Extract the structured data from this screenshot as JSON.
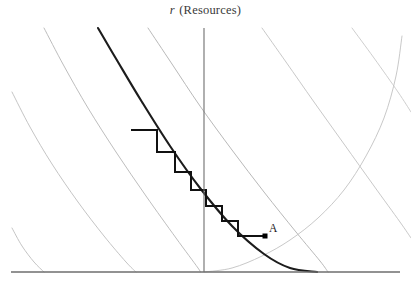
{
  "figure": {
    "width": 411,
    "height": 285,
    "background": "#ffffff"
  },
  "axis_title": {
    "symbol": "r",
    "text": " (Resources)",
    "full_text": "r (Resources)"
  },
  "labels": {
    "point_a": "A"
  },
  "colors": {
    "background": "#ffffff",
    "axis": "#6e6e6e",
    "isocline_light": "#b9b9b9",
    "isocline_mid": "#a2a2a2",
    "main_curve": "#1c1c1c",
    "staircase": "#111111",
    "point_marker": "#000000",
    "title_text": "#3a3a3a"
  },
  "chart_data": {
    "type": "line",
    "title": "r (Resources)",
    "xlabel": "",
    "ylabel": "r (Resources)",
    "grid": false,
    "legend": false,
    "axes": {
      "vertical_axis_x": 204,
      "vertical_axis_top_y": 28,
      "vertical_axis_bottom_y": 272,
      "horizontal_axis_y": 272,
      "horizontal_axis_x_start": 11,
      "horizontal_axis_x_end": 400
    },
    "isoclines": {
      "description": "family of parallel light-gray downward-convex contour curves",
      "count": 7,
      "curves": [
        {
          "name": "isocline-1",
          "shade": "#bdbdbd",
          "points": [
            [
              12,
              92
            ],
            [
              30,
              127
            ],
            [
              52,
              164
            ],
            [
              78,
              202
            ],
            [
              104,
              236
            ],
            [
              126,
              262
            ],
            [
              136,
              272
            ]
          ]
        },
        {
          "name": "isocline-2",
          "shade": "#bdbdbd",
          "points": [
            [
              12,
              228
            ],
            [
              22,
              246
            ],
            [
              34,
              262
            ],
            [
              44,
              272
            ]
          ]
        },
        {
          "name": "isocline-3",
          "shade": "#b5b5b5",
          "points": [
            [
              44,
              28
            ],
            [
              64,
              66
            ],
            [
              88,
              108
            ],
            [
              116,
              152
            ],
            [
              146,
              196
            ],
            [
              176,
              238
            ],
            [
              198,
              268
            ],
            [
              200,
              272
            ]
          ]
        },
        {
          "name": "isocline-4",
          "shade": "#b0b0b0",
          "points": [
            [
              148,
              28
            ],
            [
              172,
              64
            ],
            [
              200,
              106
            ],
            [
              232,
              150
            ],
            [
              264,
              192
            ],
            [
              296,
              232
            ],
            [
              320,
              261
            ],
            [
              328,
              272
            ]
          ]
        },
        {
          "name": "isocline-5",
          "shade": "#c2c2c2",
          "points": [
            [
              262,
              28
            ],
            [
              286,
              62
            ],
            [
              314,
              102
            ],
            [
              344,
              144
            ],
            [
              374,
              186
            ],
            [
              400,
              222
            ],
            [
              411,
              238
            ]
          ]
        },
        {
          "name": "isocline-6",
          "shade": "#c8c8c8",
          "points": [
            [
              352,
              28
            ],
            [
              374,
              58
            ],
            [
              398,
              92
            ],
            [
              411,
              112
            ]
          ]
        },
        {
          "name": "isocline-7",
          "shade": "#c2c2c2",
          "points": [
            [
              204,
              272
            ],
            [
              232,
              268
            ],
            [
              262,
              256
            ],
            [
              290,
              240
            ],
            [
              318,
              218
            ],
            [
              344,
              190
            ],
            [
              366,
              156
            ],
            [
              384,
              118
            ],
            [
              396,
              76
            ],
            [
              402,
              36
            ]
          ]
        }
      ],
      "main_curve": {
        "name": "main-isocline",
        "shade": "#1c1c1c",
        "width": 2.1,
        "points": [
          [
            98,
            28
          ],
          [
            118,
            62
          ],
          [
            142,
            102
          ],
          [
            170,
            146
          ],
          [
            200,
            188
          ],
          [
            232,
            226
          ],
          [
            264,
            254
          ],
          [
            290,
            268
          ],
          [
            317,
            272
          ]
        ]
      }
    },
    "staircase": {
      "description": "cobweb/staircase trajectory descending along the dark isocline toward point A",
      "color": "#111111",
      "width": 2.0,
      "vertices": [
        [
          131,
          130
        ],
        [
          157,
          130
        ],
        [
          157,
          152
        ],
        [
          175,
          152
        ],
        [
          175,
          172
        ],
        [
          191,
          172
        ],
        [
          191,
          190
        ],
        [
          206,
          190
        ],
        [
          206,
          206
        ],
        [
          222,
          206
        ],
        [
          222,
          221
        ],
        [
          238,
          221
        ],
        [
          238,
          236
        ],
        [
          266,
          236
        ]
      ],
      "step_count": 7,
      "start_point": [
        131,
        130
      ],
      "end_point": [
        266,
        236
      ]
    },
    "points": [
      {
        "label": "A",
        "x": 265,
        "y": 236,
        "marker": "square",
        "marker_size": 5,
        "label_x": 269,
        "label_y": 222
      }
    ]
  }
}
